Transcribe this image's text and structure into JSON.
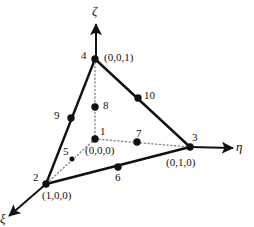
{
  "figure": {
    "background_color": "#ffffff",
    "line_color": "#111111",
    "node_color": "#111111",
    "dotted_color": "#8a8a8a",
    "width": 254,
    "height": 227
  },
  "axes": [
    {
      "name": "zeta",
      "symbol": "ζ",
      "label_x": 92,
      "label_y": 4,
      "tip_x": 96,
      "tip_y": 24,
      "tail_x": 96,
      "tail_y": 60
    },
    {
      "name": "eta",
      "symbol": "η",
      "label_x": 236,
      "label_y": 140,
      "tip_x": 233,
      "tip_y": 148,
      "tail_x": 190,
      "tail_y": 147
    },
    {
      "name": "xi",
      "symbol": "ξ",
      "label_x": 0,
      "label_y": 212,
      "tip_x": 9,
      "tip_y": 216,
      "tail_x": 46,
      "tail_y": 184
    }
  ],
  "nodes": [
    {
      "id": "1",
      "label": "1",
      "x": 95,
      "y": 139,
      "label_x": 100,
      "label_y": 126,
      "coord": "(0,0,0)",
      "coord_x": 85,
      "coord_y": 145,
      "type": "corner-origin"
    },
    {
      "id": "2",
      "label": "2",
      "x": 46,
      "y": 184,
      "label_x": 33,
      "label_y": 172,
      "coord": "(1,0,0)",
      "coord_x": 42,
      "coord_y": 190,
      "type": "corner"
    },
    {
      "id": "3",
      "label": "3",
      "x": 190,
      "y": 147,
      "label_x": 192,
      "label_y": 132,
      "coord": "(0,1,0)",
      "coord_x": 166,
      "coord_y": 157,
      "type": "corner"
    },
    {
      "id": "4",
      "label": "4",
      "x": 95,
      "y": 59,
      "label_x": 81,
      "label_y": 50,
      "coord": "(0,0,1)",
      "coord_x": 104,
      "coord_y": 52,
      "type": "corner"
    },
    {
      "id": "5",
      "label": "5",
      "x": 72,
      "y": 159,
      "label_x": 63,
      "label_y": 146,
      "coord": "",
      "coord_x": 0,
      "coord_y": 0,
      "type": "midside"
    },
    {
      "id": "6",
      "label": "6",
      "x": 118,
      "y": 167,
      "label_x": 115,
      "label_y": 172,
      "coord": "",
      "coord_x": 0,
      "coord_y": 0,
      "type": "midside"
    },
    {
      "id": "7",
      "label": "7",
      "x": 137,
      "y": 142,
      "label_x": 136,
      "label_y": 128,
      "coord": "",
      "coord_x": 0,
      "coord_y": 0,
      "type": "midside"
    },
    {
      "id": "8",
      "label": "8",
      "x": 95,
      "y": 107,
      "label_x": 103,
      "label_y": 100,
      "coord": "",
      "coord_x": 0,
      "coord_y": 0,
      "type": "midside"
    },
    {
      "id": "9",
      "label": "9",
      "x": 71,
      "y": 118,
      "label_x": 54,
      "label_y": 110,
      "coord": "",
      "coord_x": 0,
      "coord_y": 0,
      "type": "midside"
    },
    {
      "id": "10",
      "label": "10",
      "x": 138,
      "y": 98,
      "label_x": 144,
      "label_y": 90,
      "coord": "",
      "coord_x": 0,
      "coord_y": 0,
      "type": "midside"
    }
  ],
  "edges": [
    {
      "name": "edge-4-2",
      "style": "solid",
      "from": "4",
      "to": "2",
      "x1": 95,
      "y1": 59,
      "x2": 46,
      "y2": 184
    },
    {
      "name": "edge-4-3",
      "style": "solid",
      "from": "4",
      "to": "3",
      "x1": 95,
      "y1": 59,
      "x2": 190,
      "y2": 147
    },
    {
      "name": "edge-2-3",
      "style": "solid",
      "from": "2",
      "to": "3",
      "x1": 46,
      "y1": 184,
      "x2": 190,
      "y2": 147
    },
    {
      "name": "edge-4-1",
      "style": "dotted",
      "from": "4",
      "to": "1",
      "x1": 95,
      "y1": 59,
      "x2": 95,
      "y2": 139
    },
    {
      "name": "edge-1-2",
      "style": "dotted",
      "from": "1",
      "to": "2",
      "x1": 95,
      "y1": 139,
      "x2": 46,
      "y2": 184
    },
    {
      "name": "edge-1-3",
      "style": "dotted",
      "from": "1",
      "to": "3",
      "x1": 95,
      "y1": 139,
      "x2": 190,
      "y2": 147
    }
  ]
}
